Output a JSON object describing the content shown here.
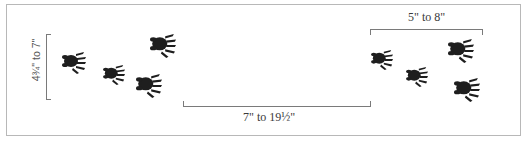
{
  "figure": {
    "measurements": {
      "straddle": "4¾\" to 7\"",
      "stride": "7\" to 19½\"",
      "group_length": "5\" to 8\""
    },
    "colors": {
      "frame": "#b8b8b8",
      "bracket": "#7a7a7a",
      "print": "#1e1e1e",
      "text": "#3a3a3a"
    },
    "prints_left_group": 4,
    "prints_right_group": 4
  }
}
